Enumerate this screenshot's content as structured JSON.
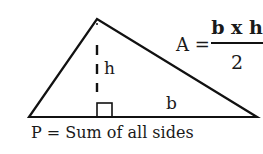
{
  "diagram": {
    "shape": "triangle",
    "height_label": "h",
    "base_label": "b",
    "area_formula": {
      "lhs": "A =",
      "numerator": "b x h",
      "denominator": "2"
    },
    "perimeter_formula": "P = Sum of all sides",
    "colors": {
      "stroke": "#111111",
      "text": "#1a1a1a",
      "background": "#ffffff"
    }
  }
}
